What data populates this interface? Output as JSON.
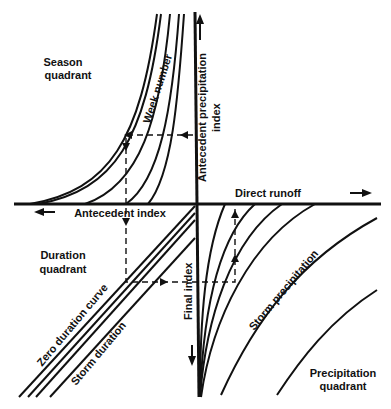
{
  "diagram": {
    "type": "four-quadrant nomograph",
    "quadrants": {
      "season": {
        "line1": "Season",
        "line2": "quadrant"
      },
      "duration": {
        "line1": "Duration",
        "line2": "quadrant"
      },
      "precipitation": {
        "line1": "Precipitation",
        "line2": "quadrant"
      }
    },
    "axes": {
      "vertical_up": {
        "line1": "Antecedent precipitation",
        "line2": "index"
      },
      "horizontal_right": "Direct runoff",
      "horizontal_left": "Antecedent index",
      "vertical_down": "Final index"
    },
    "curve_labels": {
      "week_number": "Week number",
      "zero_duration": "Zero duration curve",
      "storm_duration": "Storm duration",
      "storm_precipitation": "Storm precipitation"
    },
    "colors": {
      "ink": "#111111",
      "background": "#ffffff"
    }
  }
}
